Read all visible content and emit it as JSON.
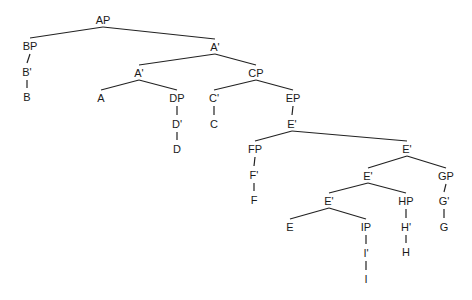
{
  "diagram": {
    "type": "syntax-tree",
    "nodes": [
      {
        "id": "AP",
        "label": "AP"
      },
      {
        "id": "BP",
        "label": "BP"
      },
      {
        "id": "B1",
        "label": "B'"
      },
      {
        "id": "B",
        "label": "B"
      },
      {
        "id": "A1a",
        "label": "A'"
      },
      {
        "id": "A1b",
        "label": "A'"
      },
      {
        "id": "A",
        "label": "A"
      },
      {
        "id": "DP",
        "label": "DP"
      },
      {
        "id": "D1",
        "label": "D'"
      },
      {
        "id": "D",
        "label": "D"
      },
      {
        "id": "CP",
        "label": "CP"
      },
      {
        "id": "C1",
        "label": "C'"
      },
      {
        "id": "C",
        "label": "C"
      },
      {
        "id": "EP",
        "label": "EP"
      },
      {
        "id": "E1a",
        "label": "E'"
      },
      {
        "id": "FP",
        "label": "FP"
      },
      {
        "id": "F1",
        "label": "F'"
      },
      {
        "id": "F",
        "label": "F"
      },
      {
        "id": "E1b",
        "label": "E'"
      },
      {
        "id": "E1c",
        "label": "E'"
      },
      {
        "id": "GP",
        "label": "GP"
      },
      {
        "id": "G1",
        "label": "G'"
      },
      {
        "id": "G",
        "label": "G"
      },
      {
        "id": "E1d",
        "label": "E'"
      },
      {
        "id": "HP",
        "label": "HP"
      },
      {
        "id": "H1",
        "label": "H'"
      },
      {
        "id": "H",
        "label": "H"
      },
      {
        "id": "E",
        "label": "E"
      },
      {
        "id": "IP",
        "label": "IP"
      },
      {
        "id": "I1",
        "label": "I'"
      },
      {
        "id": "I",
        "label": "I"
      }
    ],
    "edges": [
      [
        "AP",
        "BP"
      ],
      [
        "AP",
        "A1a"
      ],
      [
        "BP",
        "B1"
      ],
      [
        "B1",
        "B"
      ],
      [
        "A1a",
        "A1b"
      ],
      [
        "A1a",
        "CP"
      ],
      [
        "A1b",
        "A"
      ],
      [
        "A1b",
        "DP"
      ],
      [
        "DP",
        "D1"
      ],
      [
        "D1",
        "D"
      ],
      [
        "CP",
        "C1"
      ],
      [
        "CP",
        "EP"
      ],
      [
        "C1",
        "C"
      ],
      [
        "EP",
        "E1a"
      ],
      [
        "E1a",
        "FP"
      ],
      [
        "E1a",
        "E1b"
      ],
      [
        "FP",
        "F1"
      ],
      [
        "F1",
        "F"
      ],
      [
        "E1b",
        "E1c"
      ],
      [
        "E1b",
        "GP"
      ],
      [
        "GP",
        "G1"
      ],
      [
        "G1",
        "G"
      ],
      [
        "E1c",
        "E1d"
      ],
      [
        "E1c",
        "HP"
      ],
      [
        "HP",
        "H1"
      ],
      [
        "H1",
        "H"
      ],
      [
        "E1d",
        "E"
      ],
      [
        "E1d",
        "IP"
      ],
      [
        "IP",
        "I1"
      ],
      [
        "I1",
        "I"
      ]
    ]
  }
}
